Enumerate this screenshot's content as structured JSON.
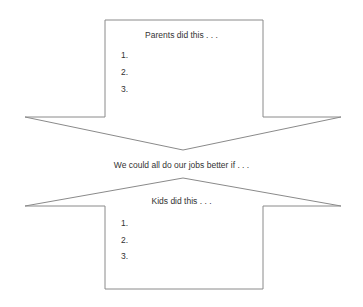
{
  "top_arrow": {
    "direction": "down",
    "heading": "Parents did this . . .",
    "items": [
      "1.",
      "2.",
      "3."
    ]
  },
  "middle_text": "We could all do our jobs better if . . .",
  "bottom_arrow": {
    "direction": "up",
    "heading": "Kids did this . . .",
    "items": [
      "1.",
      "2.",
      "3."
    ]
  },
  "colors": {
    "stroke": "#8a8a8a",
    "text": "#333333",
    "background": "#ffffff"
  }
}
